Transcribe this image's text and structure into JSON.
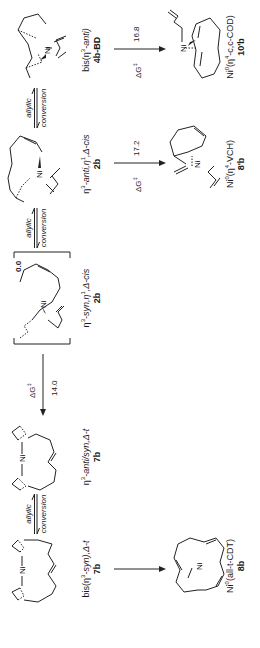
{
  "scheme": {
    "orientation": "rotated -90deg",
    "top_row": [
      {
        "id": "7b",
        "name": "bis(η3-syn),Δ-t",
        "name_parts": [
          "bis(η",
          "3",
          "-syn),Δ-t"
        ]
      },
      {
        "id": "7b",
        "name": "η3-anti/syn,Δ-t",
        "name_parts": [
          "η",
          "3",
          "-anti/syn,Δ-t"
        ]
      },
      {
        "id": "2b",
        "name": "η3-syn,η1,Δ-cis",
        "name_parts": [
          "η",
          "3",
          "-syn,η",
          "1",
          ",Δ-cis"
        ]
      },
      {
        "id": "2b",
        "name": "η3-anti,η1,Δ-cis",
        "name_parts": [
          "η",
          "3",
          "-anti,η",
          "1",
          ",Δ-cis"
        ]
      },
      {
        "id": "4b-BD",
        "name": "bis(η3-anti)",
        "name_parts": [
          "bis(η",
          "3",
          "-anti)"
        ]
      }
    ],
    "bottom_row": [
      {
        "id": "8b",
        "name": "Ni0(all-t-CDT)",
        "name_parts": [
          "Ni",
          "0",
          "(all-t-CDT)"
        ]
      },
      {
        "id": "8'b",
        "name": "Ni0(η4-VCH)",
        "name_parts": [
          "Ni",
          "0",
          "(η",
          "4",
          "-VCH)"
        ]
      },
      {
        "id": "10'b",
        "name": "Ni0(η4-c,c-COD)",
        "name_parts": [
          "Ni",
          "0",
          "(η",
          "4",
          "-c,c-COD)"
        ]
      }
    ],
    "conversions": [
      {
        "top": "allylic",
        "bottom": "conversion"
      },
      {
        "top": "allylic",
        "bottom": "conversion"
      },
      {
        "top": "allylic",
        "bottom": "conversion"
      }
    ],
    "reference_energy": "0.0",
    "barriers": [
      {
        "label": "ΔG",
        "sup": "‡",
        "value": "14.0"
      },
      {
        "label": "ΔG",
        "sup": "‡",
        "value": "17.2"
      },
      {
        "label": "ΔG",
        "sup": "‡",
        "value": "16.8"
      }
    ],
    "atom_label": "Ni"
  }
}
